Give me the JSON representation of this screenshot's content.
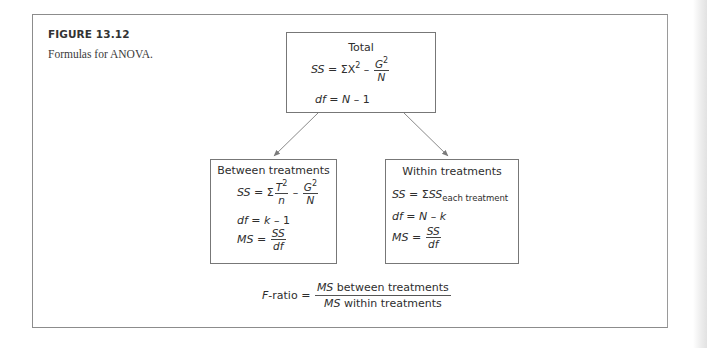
{
  "figure": {
    "label": "FIGURE 13.12",
    "caption": "Formulas for ANOVA."
  },
  "total_box": {
    "title": "Total",
    "ss_lhs": "SS",
    "ss_eq": " = ΣX",
    "ss_sq": "2",
    "ss_minus": " – ",
    "ss_frac_num_var": "G",
    "ss_frac_num_sup": "2",
    "ss_frac_den": "N",
    "df_lhs": "df",
    "df_eq": " = ",
    "df_rhs_var": "N",
    "df_rhs_rest": " – 1"
  },
  "between_box": {
    "title": "Between treatments",
    "ss_lhs": "SS",
    "ss_eq": " = Σ",
    "ss_frac1_num_var": "T",
    "ss_frac1_num_sup": "2",
    "ss_frac1_den": "n",
    "ss_minus": " – ",
    "ss_frac2_num_var": "G",
    "ss_frac2_num_sup": "2",
    "ss_frac2_den": "N",
    "df_lhs": "df",
    "df_eq": " = ",
    "df_rhs_var": "k",
    "df_rhs_rest": " – 1",
    "ms_lhs": "MS",
    "ms_eq": " = ",
    "ms_num": "SS",
    "ms_den": "df"
  },
  "within_box": {
    "title": "Within treatments",
    "ss_lhs": "SS",
    "ss_eq": " = Σ",
    "ss_rhs": "SS",
    "ss_sub": "each treatment",
    "df_lhs": "df",
    "df_eq": " = ",
    "df_rhs_var1": "N",
    "df_rhs_minus": " – ",
    "df_rhs_var2": "k",
    "ms_lhs": "MS",
    "ms_eq": " = ",
    "ms_num": "SS",
    "ms_den": "df"
  },
  "f_ratio": {
    "lhs_var": "F",
    "lhs_rest": "-ratio = ",
    "num_var": "MS",
    "num_rest": " between treatments",
    "den_var": "MS",
    "den_rest": " within treatments"
  },
  "colors": {
    "frame": "#8c8c8c",
    "box_border": "#777777",
    "arrow": "#808080",
    "text": "#2e2e2e"
  }
}
